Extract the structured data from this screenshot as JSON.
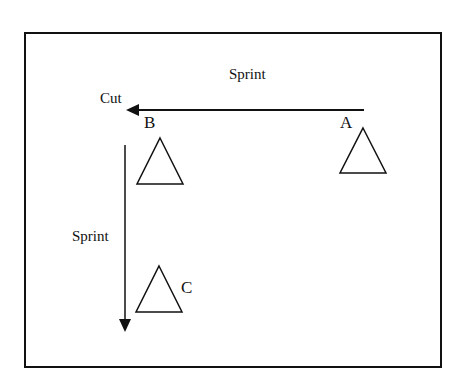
{
  "diagram": {
    "labels": {
      "sprint_top": "Sprint",
      "cut": "Cut",
      "sprint_side": "Sprint",
      "cone_a": "A",
      "cone_b": "B",
      "cone_c": "C"
    },
    "colors": {
      "stroke": "#111111",
      "background": "#ffffff"
    }
  }
}
